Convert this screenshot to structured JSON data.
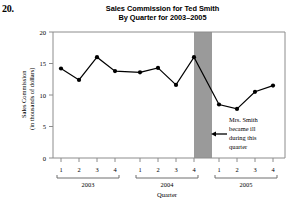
{
  "problem": {
    "number": "20."
  },
  "chart_data": {
    "type": "line",
    "title": "Sales Commission for Ted Smith",
    "subtitle": "By Quarter for 2003–2005",
    "xlabel": "Quarter",
    "ylabel": "Sales Commission",
    "ylabel_unit": "(in thousands of dollars)",
    "ylim": [
      0,
      20
    ],
    "yticks": [
      0,
      5,
      10,
      15,
      20
    ],
    "ytick_labels": [
      "0",
      "5",
      "10",
      "15",
      "20"
    ],
    "grid": false,
    "legend": "none",
    "categories": [
      "1",
      "2",
      "3",
      "4",
      "1",
      "2",
      "3",
      "4",
      "1",
      "2",
      "3",
      "4"
    ],
    "group_labels": [
      "2003",
      "2004",
      "2005"
    ],
    "groups": [
      {
        "label": "2003",
        "quarters": [
          "1",
          "2",
          "3",
          "4"
        ]
      },
      {
        "label": "2004",
        "quarters": [
          "1",
          "2",
          "3",
          "4"
        ]
      },
      {
        "label": "2005",
        "quarters": [
          "1",
          "2",
          "3",
          "4"
        ]
      }
    ],
    "values": [
      14.2,
      12.4,
      16.0,
      13.8,
      13.6,
      14.3,
      11.6,
      16.0,
      8.5,
      7.8,
      10.5,
      11.5
    ],
    "points": [
      {
        "year": "2003",
        "quarter": "1",
        "value": 14.2
      },
      {
        "year": "2003",
        "quarter": "2",
        "value": 12.4
      },
      {
        "year": "2003",
        "quarter": "3",
        "value": 16.0
      },
      {
        "year": "2003",
        "quarter": "4",
        "value": 13.8
      },
      {
        "year": "2004",
        "quarter": "1",
        "value": 13.6
      },
      {
        "year": "2004",
        "quarter": "2",
        "value": 14.3
      },
      {
        "year": "2004",
        "quarter": "3",
        "value": 11.6
      },
      {
        "year": "2004",
        "quarter": "4",
        "value": 16.0
      },
      {
        "year": "2005",
        "quarter": "1",
        "value": 8.5
      },
      {
        "year": "2005",
        "quarter": "2",
        "value": 7.8
      },
      {
        "year": "2005",
        "quarter": "3",
        "value": 10.5
      },
      {
        "year": "2005",
        "quarter": "4",
        "value": 11.5
      }
    ],
    "shaded_region": {
      "from": "2004 Q4",
      "to": "2005 Q1",
      "color": "#9a9a9a"
    },
    "annotations": [
      {
        "lines": [
          "Mrs. Smith",
          "became ill",
          "during this",
          "quarter"
        ],
        "arrow": "left-arrow"
      }
    ],
    "colors": {
      "line": "#000000",
      "marker": "#000000",
      "axis": "#808080",
      "shade": "#9a9a9a"
    }
  }
}
